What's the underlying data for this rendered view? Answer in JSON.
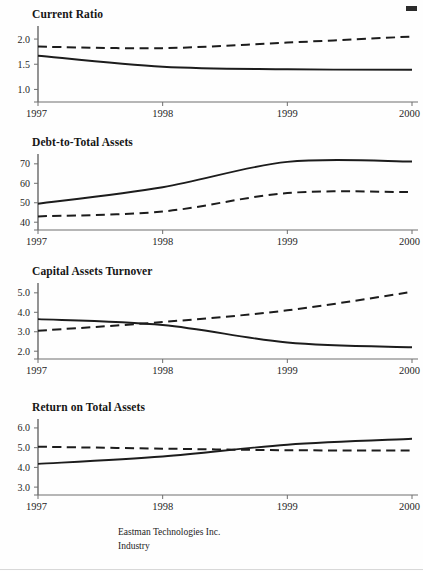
{
  "document": {
    "kind": "financial-ratio-chart-sheet",
    "years": [
      "1997",
      "1998",
      "1999",
      "2000"
    ]
  },
  "legend": {
    "entries": [
      {
        "label": "Eastman Technologies Inc.",
        "style": "solid",
        "color": "#1c1c1c"
      },
      {
        "label": "Industry",
        "style": "dashed",
        "color": "#1c1c1c"
      }
    ]
  },
  "chart_data": [
    {
      "type": "line",
      "title": "Current Ratio",
      "xlabel": "",
      "ylabel": "",
      "x": [
        "1997",
        "1998",
        "1999",
        "2000"
      ],
      "categories": [
        "1997",
        "1998",
        "1999",
        "2000"
      ],
      "yticks": [
        "2.0",
        "1.5",
        "1.0"
      ],
      "ytick_values": [
        2.0,
        1.5,
        1.0
      ],
      "ylim": [
        0.75,
        2.18
      ],
      "grid": false,
      "legend_position": "bottom",
      "series": [
        {
          "name": "Eastman Technologies Inc.",
          "style": "solid",
          "values": [
            1.67,
            1.45,
            1.4,
            1.39
          ]
        },
        {
          "name": "Industry",
          "style": "dashed",
          "values": [
            1.85,
            1.82,
            1.93,
            2.05
          ]
        }
      ]
    },
    {
      "type": "line",
      "title": "Debt-to-Total Assets",
      "xlabel": "",
      "ylabel": "",
      "x": [
        "1997",
        "1998",
        "1999",
        "2000"
      ],
      "categories": [
        "1997",
        "1998",
        "1999",
        "2000"
      ],
      "yticks": [
        "70",
        "60",
        "50",
        "40"
      ],
      "ytick_values": [
        70,
        60,
        50,
        40
      ],
      "ylim": [
        36,
        73
      ],
      "grid": false,
      "legend_position": "bottom",
      "series": [
        {
          "name": "Eastman Technologies Inc.",
          "style": "solid",
          "values": [
            49.5,
            58.0,
            71.0,
            71.2
          ]
        },
        {
          "name": "Industry",
          "style": "dashed",
          "values": [
            43.0,
            45.5,
            55.0,
            55.5
          ]
        }
      ]
    },
    {
      "type": "line",
      "title": "Capital Assets Turnover",
      "xlabel": "",
      "ylabel": "",
      "x": [
        "1997",
        "1998",
        "1999",
        "2000"
      ],
      "categories": [
        "1997",
        "1998",
        "1999",
        "2000"
      ],
      "yticks": [
        "5.0",
        "4.0",
        "3.0",
        "2.0"
      ],
      "ytick_values": [
        5.0,
        4.0,
        3.0,
        2.0
      ],
      "ylim": [
        1.6,
        5.3
      ],
      "grid": false,
      "legend_position": "bottom",
      "series": [
        {
          "name": "Eastman Technologies Inc.",
          "style": "solid",
          "values": [
            3.65,
            3.35,
            2.45,
            2.2
          ]
        },
        {
          "name": "Industry",
          "style": "dashed",
          "values": [
            3.05,
            3.5,
            4.1,
            5.05
          ]
        }
      ]
    },
    {
      "type": "line",
      "title": "Return on Total Assets",
      "xlabel": "",
      "ylabel": "",
      "x": [
        "1997",
        "1998",
        "1999",
        "2000"
      ],
      "categories": [
        "1997",
        "1998",
        "1999",
        "2000"
      ],
      "yticks": [
        "6.0",
        "5.0",
        "4.0",
        "3.0"
      ],
      "ytick_values": [
        6.0,
        5.0,
        4.0,
        3.0
      ],
      "ylim": [
        2.6,
        6.25
      ],
      "grid": false,
      "legend_position": "bottom",
      "series": [
        {
          "name": "Eastman Technologies Inc.",
          "style": "solid",
          "values": [
            4.18,
            4.55,
            5.15,
            5.45
          ]
        },
        {
          "name": "Industry",
          "style": "dashed",
          "values": [
            5.05,
            4.95,
            4.87,
            4.86
          ]
        }
      ]
    }
  ]
}
